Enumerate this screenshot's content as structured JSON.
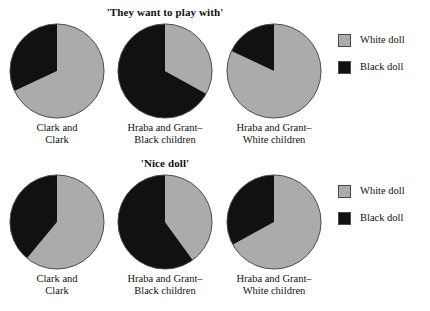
{
  "colors": {
    "white_doll": "#ababab",
    "black_doll": "#111111",
    "outline": "#4a4a4a",
    "background": "#ffffff",
    "text": "#111111"
  },
  "panels": [
    {
      "title": "'They want to play with'",
      "legend": [
        {
          "label": "White doll",
          "color_key": "white_doll"
        },
        {
          "label": "Black doll",
          "color_key": "black_doll"
        }
      ],
      "pies": [
        {
          "label_lines": [
            "Clark and",
            "Clark"
          ],
          "slices": [
            {
              "name": "White doll",
              "percent": 68
            },
            {
              "name": "Black doll",
              "percent": 32
            }
          ]
        },
        {
          "label_lines": [
            "Hraba and Grant–",
            "Black children"
          ],
          "slices": [
            {
              "name": "White doll",
              "percent": 33
            },
            {
              "name": "Black doll",
              "percent": 67
            }
          ]
        },
        {
          "label_lines": [
            "Hraba and Grant–",
            "White children"
          ],
          "slices": [
            {
              "name": "White doll",
              "percent": 82
            },
            {
              "name": "Black doll",
              "percent": 18
            }
          ]
        }
      ]
    },
    {
      "title": "'Nice doll'",
      "legend": [
        {
          "label": "White doll",
          "color_key": "white_doll"
        },
        {
          "label": "Black doll",
          "color_key": "black_doll"
        }
      ],
      "pies": [
        {
          "label_lines": [
            "Clark and",
            "Clark"
          ],
          "slices": [
            {
              "name": "White doll",
              "percent": 61
            },
            {
              "name": "Black doll",
              "percent": 39
            }
          ]
        },
        {
          "label_lines": [
            "Hraba and Grant–",
            "Black children"
          ],
          "slices": [
            {
              "name": "White doll",
              "percent": 40
            },
            {
              "name": "Black doll",
              "percent": 60
            }
          ]
        },
        {
          "label_lines": [
            "Hraba and Grant–",
            "White children"
          ],
          "slices": [
            {
              "name": "White doll",
              "percent": 67
            },
            {
              "name": "Black doll",
              "percent": 33
            }
          ]
        }
      ]
    }
  ],
  "chart_data": {
    "type": "pie",
    "charts": [
      {
        "title": "'They want to play with'",
        "categories": [
          "Clark and Clark",
          "Hraba and Grant–Black children",
          "Hraba and Grant–White children"
        ],
        "series": [
          {
            "name": "White doll",
            "values": [
              68,
              33,
              82
            ]
          },
          {
            "name": "Black doll",
            "values": [
              32,
              67,
              18
            ]
          }
        ],
        "units": "percent",
        "legend_position": "right",
        "grid": false
      },
      {
        "title": "'Nice doll'",
        "categories": [
          "Clark and Clark",
          "Hraba and Grant–Black children",
          "Hraba and Grant–White children"
        ],
        "series": [
          {
            "name": "White doll",
            "values": [
              61,
              40,
              67
            ]
          },
          {
            "name": "Black doll",
            "values": [
              39,
              60,
              33
            ]
          }
        ],
        "units": "percent",
        "legend_position": "right",
        "grid": false
      }
    ],
    "xlabel": "",
    "ylabel": "",
    "colors": {
      "White doll": "#ababab",
      "Black doll": "#111111"
    }
  }
}
